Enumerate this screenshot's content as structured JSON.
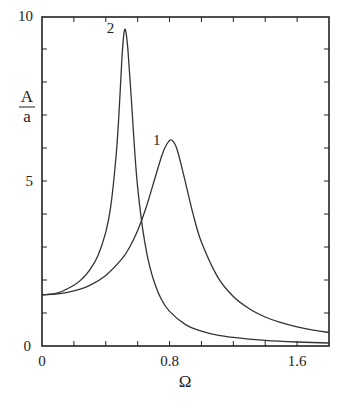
{
  "chart_data": {
    "type": "line",
    "title": "",
    "xlabel": "Ω",
    "ylabel_numerator": "A",
    "ylabel_denominator": "a",
    "xlim": [
      0,
      1.8
    ],
    "ylim": [
      0,
      10.2
    ],
    "x_ticks": [
      0,
      0.2,
      0.4,
      0.6,
      0.8,
      1.0,
      1.2,
      1.4,
      1.6,
      1.8
    ],
    "x_tick_labels": [
      {
        "value": 0,
        "label": "0"
      },
      {
        "value": 0.8,
        "label": "0.8"
      },
      {
        "value": 1.6,
        "label": "1.6"
      }
    ],
    "y_ticks": [
      0,
      1,
      2,
      3,
      4,
      5,
      6,
      7,
      8,
      9,
      10
    ],
    "y_tick_labels": [
      {
        "value": 0,
        "label": "0"
      },
      {
        "value": 5,
        "label": "5"
      },
      {
        "value": 10,
        "label": "10"
      }
    ],
    "grid": false,
    "legend": "none (curves labeled inline)",
    "series": [
      {
        "name": "1",
        "label_position": {
          "x": 0.72,
          "y": 6.1
        },
        "x": [
          0.0,
          0.1,
          0.2,
          0.3,
          0.4,
          0.5,
          0.55,
          0.6,
          0.65,
          0.7,
          0.75,
          0.78,
          0.81,
          0.84,
          0.87,
          0.9,
          0.95,
          1.0,
          1.1,
          1.2,
          1.3,
          1.4,
          1.5,
          1.6,
          1.7,
          1.8
        ],
        "values": [
          1.55,
          1.58,
          1.67,
          1.84,
          2.14,
          2.63,
          3.0,
          3.5,
          4.15,
          4.95,
          5.75,
          6.1,
          6.25,
          6.05,
          5.55,
          4.95,
          3.95,
          3.15,
          2.1,
          1.5,
          1.13,
          0.88,
          0.71,
          0.58,
          0.48,
          0.41
        ]
      },
      {
        "name": "2",
        "label_position": {
          "x": 0.43,
          "y": 9.5
        },
        "x": [
          0.0,
          0.1,
          0.2,
          0.25,
          0.3,
          0.35,
          0.4,
          0.43,
          0.46,
          0.48,
          0.5,
          0.51,
          0.52,
          0.53,
          0.54,
          0.56,
          0.58,
          0.6,
          0.63,
          0.66,
          0.7,
          0.75,
          0.8,
          0.9,
          1.0,
          1.1,
          1.2,
          1.4,
          1.6,
          1.8
        ],
        "values": [
          1.55,
          1.61,
          1.84,
          2.03,
          2.31,
          2.73,
          3.45,
          4.2,
          5.5,
          6.8,
          8.6,
          9.3,
          9.6,
          9.4,
          8.9,
          7.5,
          6.0,
          4.8,
          3.6,
          2.75,
          2.0,
          1.4,
          1.05,
          0.65,
          0.45,
          0.33,
          0.26,
          0.17,
          0.12,
          0.09
        ]
      }
    ]
  },
  "layout": {
    "plot_left": 42,
    "plot_right": 329,
    "plot_top": 17,
    "plot_bottom": 346,
    "line_color": "#333333",
    "axis_color": "#222222"
  }
}
